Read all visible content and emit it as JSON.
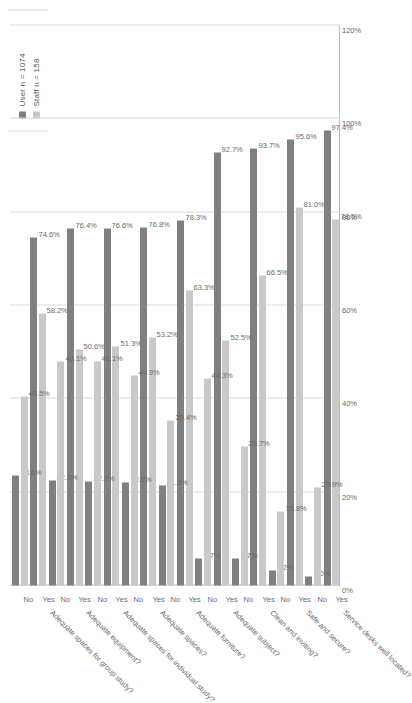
{
  "chart_data": {
    "type": "bar",
    "orientation": "horizontal",
    "title": "",
    "xlabel": "",
    "ylabel": "",
    "xlim": [
      0,
      1.2
    ],
    "grid": true,
    "legend_position": "top-left",
    "axis_ticks": [
      "0%",
      "20%",
      "40%",
      "60%",
      "80%",
      "100%",
      "120%"
    ],
    "response_labels": [
      "Yes",
      "No"
    ],
    "series": [
      {
        "name": "User",
        "n_label": "User  n = 1074",
        "color": "#808080"
      },
      {
        "name": "Staff",
        "n_label": "Staff  n = 158",
        "color": "#c9c9c9"
      }
    ],
    "categories": [
      {
        "label": "Service desks well located?",
        "responses": [
          {
            "response": "Yes",
            "User": 97.4,
            "Staff": 78.5,
            "User_label": "97.4%",
            "Staff_label": "78.5%"
          },
          {
            "response": "No",
            "User": 2.0,
            "Staff": 20.9,
            "User_label": "2.0%",
            "Staff_label": "20.9%"
          }
        ]
      },
      {
        "label": "Safe and secure?",
        "responses": [
          {
            "response": "Yes",
            "User": 95.6,
            "Staff": 81.0,
            "User_label": "95.6%",
            "Staff_label": "81.0%"
          },
          {
            "response": "No",
            "User": 3.2,
            "Staff": 15.8,
            "User_label": "3.2%",
            "Staff_label": "15.8%"
          }
        ]
      },
      {
        "label": "Clean and inviting?",
        "responses": [
          {
            "response": "Yes",
            "User": 93.7,
            "Staff": 66.5,
            "User_label": "93.7%",
            "Staff_label": "66.5%"
          },
          {
            "response": "No",
            "User": 5.7,
            "Staff": 29.7,
            "User_label": "5.7%",
            "Staff_label": "29.7%"
          }
        ]
      },
      {
        "label": "Adequate subject?",
        "responses": [
          {
            "response": "Yes",
            "User": 92.7,
            "Staff": 52.5,
            "User_label": "92.7%",
            "Staff_label": "52.5%"
          },
          {
            "response": "No",
            "User": 5.7,
            "Staff": 44.3,
            "User_label": "5.7%",
            "Staff_label": "44.3%"
          }
        ]
      },
      {
        "label": "Adequate furniture?",
        "responses": [
          {
            "response": "Yes",
            "User": 78.3,
            "Staff": 63.3,
            "User_label": "78.3%",
            "Staff_label": "63.3%"
          },
          {
            "response": "No",
            "User": 21.5,
            "Staff": 35.4,
            "User_label": "21.5%",
            "Staff_label": "35.4%"
          }
        ]
      },
      {
        "label": "Adequate spaces?",
        "responses": [
          {
            "response": "Yes",
            "User": 76.8,
            "Staff": 53.2,
            "User_label": "76.8%",
            "Staff_label": "53.2%"
          },
          {
            "response": "No",
            "User": 22.0,
            "Staff": 44.9,
            "User_label": "22.0%",
            "Staff_label": "44.9%"
          }
        ]
      },
      {
        "label": "Adequate spaces for individual study?",
        "responses": [
          {
            "response": "Yes",
            "User": 76.6,
            "Staff": 51.3,
            "User_label": "76.6%",
            "Staff_label": "51.3%"
          },
          {
            "response": "No",
            "User": 22.3,
            "Staff": 48.1,
            "User_label": "22.3%",
            "Staff_label": "48.1%"
          }
        ]
      },
      {
        "label": "Adequate equipment?",
        "responses": [
          {
            "response": "Yes",
            "User": 76.4,
            "Staff": 50.6,
            "User_label": "76.4%",
            "Staff_label": "50.6%"
          },
          {
            "response": "No",
            "User": 22.4,
            "Staff": 48.1,
            "User_label": "22.4%",
            "Staff_label": "48.1%"
          }
        ]
      },
      {
        "label": "Adequate spaces for group study?",
        "responses": [
          {
            "response": "Yes",
            "User": 74.6,
            "Staff": 58.2,
            "User_label": "74.6%",
            "Staff_label": "58.2%"
          },
          {
            "response": "No",
            "User": 23.6,
            "Staff": 40.5,
            "User_label": "23.6%",
            "Staff_label": "40.5%"
          }
        ]
      }
    ]
  }
}
